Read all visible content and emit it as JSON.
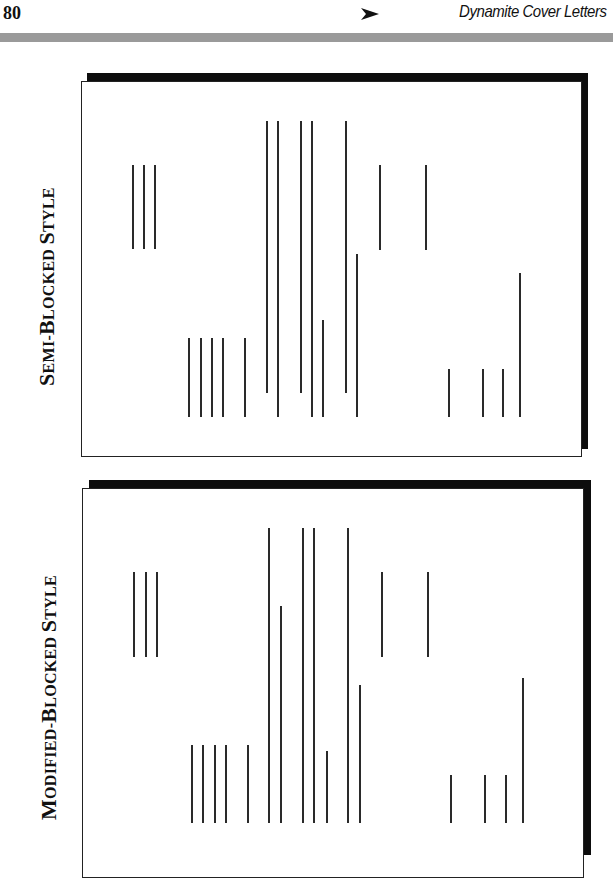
{
  "header": {
    "page_number": "80",
    "running_title": "Dynamite Cover Letters",
    "arrow_icon": "right-arrowhead-icon",
    "rule_color": "#9a9a9a"
  },
  "figures": [
    {
      "id": "semi-blocked",
      "label": {
        "cap1": "S",
        "rest1": "EMI-",
        "cap2": "B",
        "rest2": "LOCKED ",
        "cap3": "S",
        "rest3": "TYLE"
      },
      "label_text": "Semi-Blocked Style",
      "panel": {
        "left": 81,
        "top": 81,
        "right": 581,
        "bottom": 457
      },
      "shadow": {
        "top_bar": [
          87,
          73,
          588,
          81
        ],
        "right_bar": [
          580,
          73,
          588,
          449
        ]
      },
      "lines": [
        [
          132,
          165,
          249
        ],
        [
          143,
          165,
          249
        ],
        [
          154,
          165,
          249
        ],
        [
          188,
          338,
          417
        ],
        [
          200,
          338,
          417
        ],
        [
          211,
          338,
          417
        ],
        [
          222,
          338,
          417
        ],
        [
          244,
          338,
          417
        ],
        [
          266,
          121,
          393
        ],
        [
          277,
          121,
          417
        ],
        [
          300,
          121,
          393
        ],
        [
          311,
          121,
          417
        ],
        [
          322,
          320,
          417
        ],
        [
          345,
          121,
          393
        ],
        [
          356,
          254,
          417
        ],
        [
          379,
          165,
          250
        ],
        [
          425,
          165,
          250
        ],
        [
          448,
          369,
          417
        ],
        [
          482,
          369,
          417
        ],
        [
          502,
          369,
          417
        ],
        [
          519,
          273,
          417
        ]
      ]
    },
    {
      "id": "modified-blocked",
      "label": {
        "cap1": "M",
        "rest1": "ODIFIED-",
        "cap2": "B",
        "rest2": "LOCKED ",
        "cap3": "S",
        "rest3": "TYLE"
      },
      "label_text": "Modified-Blocked Style",
      "panel": {
        "left": 82,
        "top": 488,
        "right": 584,
        "bottom": 870
      },
      "shadow": {
        "top_bar": [
          89,
          480,
          591,
          489
        ],
        "right_bar": [
          583,
          480,
          591,
          855
        ]
      },
      "lines": [
        [
          133,
          572,
          657
        ],
        [
          145,
          572,
          657
        ],
        [
          156,
          572,
          657
        ],
        [
          191,
          745,
          823
        ],
        [
          202,
          745,
          823
        ],
        [
          214,
          745,
          823
        ],
        [
          225,
          745,
          823
        ],
        [
          247,
          745,
          823
        ],
        [
          268,
          528,
          823
        ],
        [
          280,
          606,
          823
        ],
        [
          302,
          528,
          823
        ],
        [
          313,
          528,
          823
        ],
        [
          326,
          751,
          823
        ],
        [
          347,
          528,
          823
        ],
        [
          359,
          685,
          823
        ],
        [
          381,
          572,
          657
        ],
        [
          427,
          572,
          657
        ],
        [
          450,
          775,
          823
        ],
        [
          484,
          775,
          823
        ],
        [
          505,
          775,
          823
        ],
        [
          522,
          678,
          823
        ]
      ]
    }
  ]
}
